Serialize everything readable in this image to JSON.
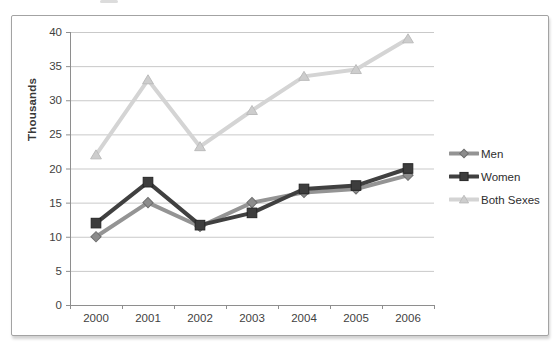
{
  "chart": {
    "background": "#ffffff",
    "frame_border_color": "#a3a3a3",
    "gridline_color": "#c9c9c9",
    "axis_color": "#8e8e8e",
    "tick_label_color": "#3f3f3f"
  },
  "chart_data": {
    "type": "line",
    "title": "",
    "xlabel": "",
    "ylabel": "Thousands",
    "categories": [
      "2000",
      "2001",
      "2002",
      "2003",
      "2004",
      "2005",
      "2006"
    ],
    "series": [
      {
        "name": "Men",
        "marker": "diamond",
        "line_color": "#949494",
        "marker_fill": "#8c8c8c",
        "marker_stroke": "#6f6f6f",
        "values": [
          10,
          15,
          11.5,
          15,
          16.5,
          17,
          19
        ]
      },
      {
        "name": "Women",
        "marker": "square",
        "line_color": "#404040",
        "marker_fill": "#3d3d3d",
        "marker_stroke": "#262626",
        "values": [
          12,
          18,
          11.7,
          13.5,
          17,
          17.5,
          20
        ]
      },
      {
        "name": "Both Sexes",
        "marker": "triangle",
        "line_color": "#d4d4d4",
        "marker_fill": "#cdcdcd",
        "marker_stroke": "#bcbcbc",
        "values": [
          22,
          33,
          23.2,
          28.5,
          33.5,
          34.5,
          39
        ]
      }
    ],
    "ylim": [
      0,
      40
    ],
    "yticks": [
      0,
      5,
      10,
      15,
      20,
      25,
      30,
      35,
      40
    ],
    "grid": true,
    "legend_position": "right"
  }
}
